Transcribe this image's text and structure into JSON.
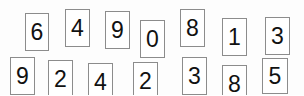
{
  "captcha": {
    "background_color": "#fdfdfd",
    "tile_background_color": "#ffffff",
    "tile_border_color": "#8c8c8c",
    "digit_color": "#111111",
    "code_top_row": "6 4 9 0 8 1 3",
    "code_bottom_row": "9 2 4 2 3 8 5",
    "tiles": [
      {
        "digit": "6",
        "x": 25,
        "y": 13,
        "w": 24,
        "h": 38,
        "font_size": 23,
        "rotation": 0
      },
      {
        "digit": "4",
        "x": 65,
        "y": 9,
        "w": 25,
        "h": 38,
        "font_size": 23,
        "rotation": 0
      },
      {
        "digit": "9",
        "x": 105,
        "y": 11,
        "w": 25,
        "h": 38,
        "font_size": 23,
        "rotation": 0
      },
      {
        "digit": "0",
        "x": 140,
        "y": 20,
        "w": 25,
        "h": 38,
        "font_size": 23,
        "rotation": 0
      },
      {
        "digit": "8",
        "x": 180,
        "y": 9,
        "w": 25,
        "h": 38,
        "font_size": 23,
        "rotation": 0
      },
      {
        "digit": "1",
        "x": 222,
        "y": 18,
        "w": 25,
        "h": 38,
        "font_size": 23,
        "rotation": 0
      },
      {
        "digit": "3",
        "x": 265,
        "y": 17,
        "w": 25,
        "h": 38,
        "font_size": 23,
        "rotation": 0
      },
      {
        "digit": "9",
        "x": 10,
        "y": 57,
        "w": 25,
        "h": 38,
        "font_size": 23,
        "rotation": 0
      },
      {
        "digit": "2",
        "x": 48,
        "y": 60,
        "w": 25,
        "h": 38,
        "font_size": 23,
        "rotation": 0
      },
      {
        "digit": "4",
        "x": 88,
        "y": 63,
        "w": 25,
        "h": 38,
        "font_size": 23,
        "rotation": 0
      },
      {
        "digit": "2",
        "x": 133,
        "y": 62,
        "w": 25,
        "h": 38,
        "font_size": 23,
        "rotation": 0
      },
      {
        "digit": "3",
        "x": 182,
        "y": 57,
        "w": 25,
        "h": 38,
        "font_size": 23,
        "rotation": 0
      },
      {
        "digit": "8",
        "x": 222,
        "y": 65,
        "w": 25,
        "h": 38,
        "font_size": 23,
        "rotation": 0
      },
      {
        "digit": "5",
        "x": 262,
        "y": 58,
        "w": 26,
        "h": 36,
        "font_size": 23,
        "rotation": 0
      }
    ]
  }
}
